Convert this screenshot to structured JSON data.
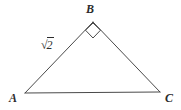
{
  "figure": {
    "kind": "geometry-diagram",
    "shape": "right-triangle",
    "background_color": "#ffffff",
    "stroke_color": "#4a4a4a",
    "text_color": "#2b2b2b",
    "stroke_width": 1
  },
  "vertices": [
    {
      "id": "A",
      "label": "A",
      "x": 25,
      "y": 93
    },
    {
      "id": "B",
      "label": "B",
      "x": 93,
      "y": 22
    },
    {
      "id": "C",
      "label": "C",
      "x": 160,
      "y": 92
    }
  ],
  "sides": [
    {
      "id": "AB",
      "from": "A",
      "to": "B",
      "label": "√2",
      "radical_sign": "√",
      "radicand": "2"
    },
    {
      "id": "BC",
      "from": "B",
      "to": "C",
      "label": ""
    },
    {
      "id": "AC",
      "from": "A",
      "to": "C",
      "label": ""
    }
  ],
  "angle_marks": [
    {
      "at": "B",
      "type": "right-angle",
      "symbol": "square",
      "size": 11
    }
  ],
  "labels": {
    "vertex_a": "A",
    "vertex_b": "B",
    "vertex_c": "C",
    "side_ab_radical": "√",
    "side_ab_radicand": "2"
  }
}
